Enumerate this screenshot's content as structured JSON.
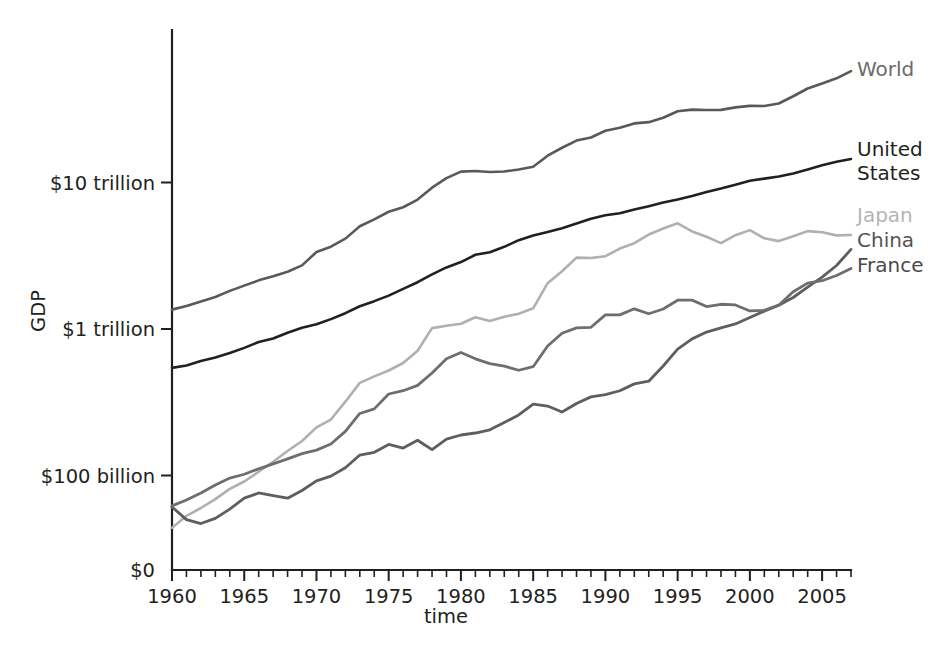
{
  "chart_data": {
    "type": "line",
    "title": "",
    "xlabel": "time",
    "ylabel": "GDP",
    "yscale": "log",
    "grid": false,
    "legend_position": "right-inline",
    "xlim": [
      1960,
      2007
    ],
    "ylim_labels": [
      "$0",
      "$100 billion",
      "$1 trillion",
      "$10 trillion"
    ],
    "x_tick_labels": [
      "1960",
      "1965",
      "1970",
      "1975",
      "1980",
      "1985",
      "1990",
      "1995",
      "2000",
      "2005"
    ],
    "x_tick_values": [
      1960,
      1965,
      1970,
      1975,
      1980,
      1985,
      1990,
      1995,
      2000,
      2005
    ],
    "x_minor_step": 1,
    "y_tick_labels": [
      "$10 trillion",
      "$1 trillion",
      "$100 billion",
      "$0"
    ],
    "y_tick_values": [
      10000,
      1000,
      100,
      0
    ],
    "y_units": "billions of USD",
    "x": [
      1960,
      1961,
      1962,
      1963,
      1964,
      1965,
      1966,
      1967,
      1968,
      1969,
      1970,
      1971,
      1972,
      1973,
      1974,
      1975,
      1976,
      1977,
      1978,
      1979,
      1980,
      1981,
      1982,
      1983,
      1984,
      1985,
      1986,
      1987,
      1988,
      1989,
      1990,
      1991,
      1992,
      1993,
      1994,
      1995,
      1996,
      1997,
      1998,
      1999,
      2000,
      2001,
      2002,
      2003,
      2004,
      2005,
      2006,
      2007
    ],
    "series": [
      {
        "name": "World",
        "color": "#595959",
        "label_color": "#6b6b6b",
        "width": 2.6,
        "label_x": 857,
        "label_y": 76,
        "values": [
          1356,
          1437,
          1540,
          1654,
          1820,
          1978,
          2148,
          2291,
          2459,
          2718,
          3351,
          3647,
          4139,
          5030,
          5608,
          6315,
          6776,
          7646,
          9215,
          10721,
          11863,
          11985,
          11786,
          11899,
          12266,
          12812,
          15237,
          17270,
          19322,
          20272,
          22562,
          23674,
          25312,
          25821,
          27652,
          30640,
          31427,
          31275,
          31320,
          32562,
          33333,
          33274,
          34600,
          38800,
          43800,
          47400,
          51400,
          57600
        ]
      },
      {
        "name": "United States",
        "color": "#231f20",
        "label_color": "#231f20",
        "width": 2.6,
        "label_x": 857,
        "label_y": 156,
        "label_line2_y": 180,
        "values": [
          543,
          563,
          605,
          638,
          685,
          743,
          815,
          861,
          942,
          1020,
          1076,
          1168,
          1282,
          1429,
          1549,
          1689,
          1878,
          2086,
          2357,
          2632,
          2863,
          3211,
          3345,
          3638,
          4041,
          4347,
          4590,
          4870,
          5253,
          5658,
          5980,
          6174,
          6539,
          6879,
          7309,
          7664,
          8100,
          8609,
          9089,
          9661,
          10290,
          10625,
          10980,
          11512,
          12277,
          13095,
          13858,
          14480
        ]
      },
      {
        "name": "Japan",
        "color": "#b0b0b0",
        "label_color": "#b5b5b5",
        "width": 2.6,
        "label_x": 857,
        "label_y": 222,
        "values": [
          44,
          53,
          60,
          69,
          81,
          91,
          106,
          124,
          147,
          172,
          213,
          241,
          319,
          429,
          475,
          521,
          586,
          710,
          1014,
          1053,
          1087,
          1202,
          1134,
          1213,
          1272,
          1385,
          2056,
          2477,
          3072,
          3054,
          3140,
          3540,
          3852,
          4415,
          4850,
          5265,
          4636,
          4261,
          3857,
          4368,
          4731,
          4160,
          3981,
          4303,
          4656,
          4572,
          4357,
          4380
        ]
      },
      {
        "name": "China",
        "color": "#5e5e5e",
        "label_color": "#545454",
        "width": 2.8,
        "label_x": 857,
        "label_y": 247,
        "values": [
          61,
          50,
          47,
          51,
          59,
          70,
          76,
          73,
          70,
          79,
          92,
          99,
          113,
          138,
          144,
          163,
          154,
          174,
          150,
          177,
          189,
          195,
          205,
          230,
          259,
          307,
          298,
          271,
          310,
          344,
          357,
          379,
          422,
          440,
          559,
          728,
          856,
          953,
          1019,
          1083,
          1198,
          1325,
          1454,
          1641,
          1932,
          2257,
          2713,
          3494
        ]
      },
      {
        "name": "France",
        "color": "#6e6e6e",
        "label_color": "#4a4a4a",
        "width": 2.8,
        "label_x": 857,
        "label_y": 272,
        "values": [
          62,
          68,
          76,
          86,
          96,
          102,
          111,
          120,
          130,
          141,
          149,
          164,
          200,
          265,
          285,
          360,
          379,
          412,
          501,
          627,
          691,
          626,
          580,
          558,
          523,
          553,
          765,
          935,
          1018,
          1027,
          1248,
          1248,
          1373,
          1270,
          1369,
          1572,
          1574,
          1423,
          1475,
          1460,
          1328,
          1340,
          1454,
          1794,
          2056,
          2136,
          2319,
          2587
        ]
      }
    ]
  },
  "axes": {
    "y_axis_title": "GDP",
    "x_axis_title": "time"
  }
}
